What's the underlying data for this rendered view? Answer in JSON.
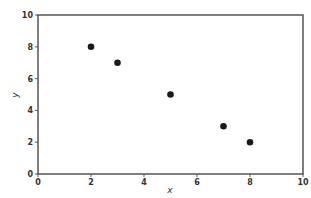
{
  "chart_data": {
    "type": "scatter",
    "title": "",
    "xlabel": "x",
    "ylabel": "y",
    "xlim": [
      0,
      10
    ],
    "ylim": [
      0,
      10
    ],
    "xticks": [
      0,
      2,
      4,
      6,
      8,
      10
    ],
    "yticks": [
      0,
      2,
      4,
      6,
      8,
      10
    ],
    "grid": false,
    "legend": null,
    "series": [
      {
        "name": "points",
        "color": "#1a1a1a",
        "points": [
          {
            "x": 2,
            "y": 8
          },
          {
            "x": 3,
            "y": 7
          },
          {
            "x": 5,
            "y": 5
          },
          {
            "x": 7,
            "y": 3
          },
          {
            "x": 8,
            "y": 2
          }
        ]
      }
    ]
  },
  "colors": {
    "axis": "#555555",
    "marker": "#1a1a1a",
    "background": "#ffffff"
  }
}
